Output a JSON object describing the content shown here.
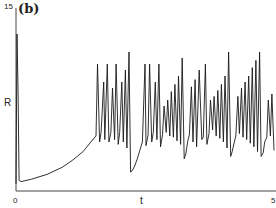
{
  "chart_data": {
    "type": "line",
    "title": "(b)",
    "xlabel": "t",
    "ylabel": "R",
    "xlim": [
      0,
      5
    ],
    "ylim": [
      0,
      15
    ],
    "x_ticks": [
      "0",
      "5"
    ],
    "y_ticks": [
      "15"
    ],
    "grid": false,
    "legend": null,
    "series": [
      {
        "name": "R(t)",
        "x": [
          0.0,
          0.02,
          0.04,
          0.06,
          0.1,
          0.3,
          0.6,
          0.9,
          1.1,
          1.3,
          1.45,
          1.55,
          1.58,
          1.62,
          1.65,
          1.7,
          1.72,
          1.77,
          1.8,
          1.84,
          1.87,
          1.91,
          1.94,
          1.98,
          2.01,
          2.05,
          2.08,
          2.12,
          2.15,
          2.19,
          2.22,
          2.25,
          2.3,
          2.35,
          2.4,
          2.45,
          2.5,
          2.52,
          2.56,
          2.59,
          2.63,
          2.66,
          2.7,
          2.73,
          2.77,
          2.8,
          2.84,
          2.87,
          2.91,
          2.94,
          2.98,
          3.01,
          3.05,
          3.08,
          3.12,
          3.15,
          3.19,
          3.22,
          3.26,
          3.29,
          3.33,
          3.36,
          3.4,
          3.43,
          3.47,
          3.5,
          3.55,
          3.6,
          3.63,
          3.67,
          3.7,
          3.74,
          3.77,
          3.81,
          3.84,
          3.88,
          3.91,
          3.95,
          3.98,
          4.02,
          4.05,
          4.09,
          4.12,
          4.16,
          4.19,
          4.23,
          4.26,
          4.3,
          4.33,
          4.37,
          4.4,
          4.44,
          4.47,
          4.51,
          4.54,
          4.58,
          4.61,
          4.65,
          4.68,
          4.72,
          4.75,
          4.79,
          4.82,
          4.86,
          4.89,
          4.93,
          4.96,
          5.0
        ],
        "values": [
          0.5,
          13.0,
          8.0,
          0.8,
          0.7,
          0.9,
          1.3,
          1.9,
          2.5,
          3.2,
          4.0,
          4.5,
          10.5,
          4.0,
          4.8,
          9.0,
          4.2,
          10.5,
          4.0,
          4.8,
          8.5,
          4.2,
          10.5,
          3.8,
          4.8,
          9.0,
          4.0,
          10.0,
          3.5,
          11.5,
          1.5,
          1.6,
          2.0,
          2.6,
          3.3,
          4.0,
          10.5,
          3.7,
          4.6,
          10.5,
          4.0,
          4.8,
          9.0,
          4.2,
          10.5,
          3.6,
          4.6,
          7.0,
          4.8,
          7.5,
          4.5,
          8.2,
          4.4,
          8.8,
          4.1,
          9.5,
          3.8,
          11.0,
          2.6,
          3.0,
          4.1,
          4.6,
          8.6,
          4.0,
          9.2,
          3.6,
          10.0,
          4.2,
          4.4,
          10.5,
          3.8,
          4.7,
          7.5,
          5.0,
          7.8,
          4.5,
          8.3,
          4.3,
          8.8,
          4.0,
          9.5,
          3.5,
          11.5,
          2.8,
          3.2,
          4.0,
          4.5,
          7.8,
          4.7,
          8.5,
          4.4,
          9.0,
          4.2,
          9.5,
          3.9,
          10.2,
          3.6,
          10.8,
          3.2,
          11.5,
          2.8,
          3.1,
          4.0,
          4.4,
          7.5,
          4.5,
          8.0,
          3.3
        ]
      }
    ]
  },
  "labels": {
    "panel": "(b)",
    "y_axis": "R",
    "x_axis": "t",
    "y_top_tick": "15",
    "x_tick_start": "0",
    "x_tick_end": "5"
  },
  "colors": {
    "line": "#1a1a1a",
    "axis": "#444444",
    "background": "#ffffff"
  }
}
